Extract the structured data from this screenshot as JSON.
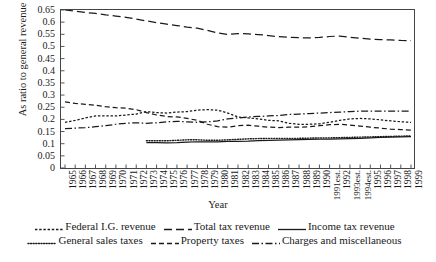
{
  "chart_data": {
    "type": "line",
    "title": "",
    "xlabel": "Year",
    "ylabel": "As ratio to general revenue",
    "ylim": [
      0,
      0.65
    ],
    "yticks": [
      "0.65",
      "0.6",
      "0.55",
      "0.5",
      "0.45",
      "0.4",
      "0.35",
      "0.3",
      "0.25",
      "0.2",
      "0.15",
      "0.1",
      "0.05",
      "0"
    ],
    "grid": false,
    "legend_position": "bottom",
    "categories": [
      "1965",
      "1966",
      "1967",
      "1968",
      "1969",
      "1970",
      "1971",
      "1972",
      "1973",
      "1974",
      "1975",
      "1976",
      "1977",
      "1978",
      "1979",
      "1980",
      "1981",
      "1982",
      "1983",
      "1984",
      "1985",
      "1986",
      "1987",
      "1988",
      "1989",
      "1990",
      "1991est.",
      "1992",
      "1993est.",
      "1994est.",
      "1995",
      "1996",
      "1997",
      "1998",
      "1999"
    ],
    "series": [
      {
        "name": "Total tax revenue",
        "style": "long-dash",
        "values": [
          0.65,
          0.645,
          0.64,
          0.636,
          0.63,
          0.625,
          0.62,
          0.613,
          0.605,
          0.598,
          0.592,
          0.586,
          0.58,
          0.575,
          0.566,
          0.556,
          0.549,
          0.553,
          0.552,
          0.549,
          0.545,
          0.54,
          0.538,
          0.536,
          0.535,
          0.537,
          0.541,
          0.543,
          0.538,
          0.534,
          0.53,
          0.528,
          0.527,
          0.525,
          0.524
        ]
      },
      {
        "name": "Property taxes",
        "style": "dash",
        "values": [
          0.272,
          0.266,
          0.262,
          0.258,
          0.252,
          0.248,
          0.246,
          0.24,
          0.228,
          0.218,
          0.212,
          0.21,
          0.204,
          0.196,
          0.18,
          0.17,
          0.168,
          0.174,
          0.176,
          0.172,
          0.168,
          0.166,
          0.168,
          0.168,
          0.17,
          0.174,
          0.178,
          0.18,
          0.176,
          0.172,
          0.168,
          0.164,
          0.16,
          0.158,
          0.156
        ]
      },
      {
        "name": "Federal I.G. revenue",
        "style": "short-dash",
        "values": [
          0.188,
          0.196,
          0.206,
          0.214,
          0.214,
          0.214,
          0.218,
          0.222,
          0.232,
          0.228,
          0.226,
          0.23,
          0.232,
          0.238,
          0.24,
          0.238,
          0.226,
          0.21,
          0.206,
          0.202,
          0.196,
          0.194,
          0.184,
          0.18,
          0.18,
          0.182,
          0.188,
          0.196,
          0.202,
          0.204,
          0.202,
          0.198,
          0.194,
          0.19,
          0.188
        ]
      },
      {
        "name": "Charges and miscellaneous",
        "style": "dash-dot",
        "values": [
          0.162,
          0.164,
          0.166,
          0.17,
          0.174,
          0.18,
          0.184,
          0.186,
          0.184,
          0.186,
          0.19,
          0.192,
          0.19,
          0.188,
          0.19,
          0.194,
          0.202,
          0.206,
          0.21,
          0.212,
          0.214,
          0.216,
          0.22,
          0.222,
          0.224,
          0.226,
          0.228,
          0.23,
          0.232,
          0.234,
          0.234,
          0.234,
          0.234,
          0.234,
          0.234
        ]
      },
      {
        "name": "General sales taxes",
        "style": "dot",
        "values": [
          null,
          null,
          null,
          null,
          null,
          null,
          null,
          null,
          0.112,
          0.112,
          0.112,
          0.114,
          0.116,
          0.116,
          0.114,
          0.114,
          0.116,
          0.118,
          0.12,
          0.121,
          0.122,
          0.122,
          0.122,
          0.122,
          0.123,
          0.124,
          0.124,
          0.125,
          0.126,
          0.127,
          0.128,
          0.129,
          0.13,
          0.131,
          0.132
        ]
      },
      {
        "name": "Income tax revenue",
        "style": "solid",
        "values": [
          null,
          null,
          null,
          null,
          null,
          null,
          null,
          null,
          0.104,
          0.104,
          0.103,
          0.104,
          0.106,
          0.108,
          0.108,
          0.108,
          0.11,
          0.11,
          0.111,
          0.113,
          0.114,
          0.115,
          0.116,
          0.117,
          0.118,
          0.119,
          0.119,
          0.12,
          0.121,
          0.122,
          0.124,
          0.126,
          0.127,
          0.128,
          0.129
        ]
      }
    ]
  },
  "legend": {
    "row1": [
      {
        "label": "Federal I.G. revenue",
        "style": "short-dash"
      },
      {
        "label": "Total tax revenue",
        "style": "long-dash"
      },
      {
        "label": "Income tax revenue",
        "style": "solid"
      }
    ],
    "row2": [
      {
        "label": "General sales taxes",
        "style": "dot"
      },
      {
        "label": "Property taxes",
        "style": "dash"
      },
      {
        "label": "Charges and miscellaneous",
        "style": "dash-dot"
      }
    ]
  },
  "colors": {
    "line": "#1a1a1a",
    "axis": "#444444",
    "background": "#ffffff"
  }
}
